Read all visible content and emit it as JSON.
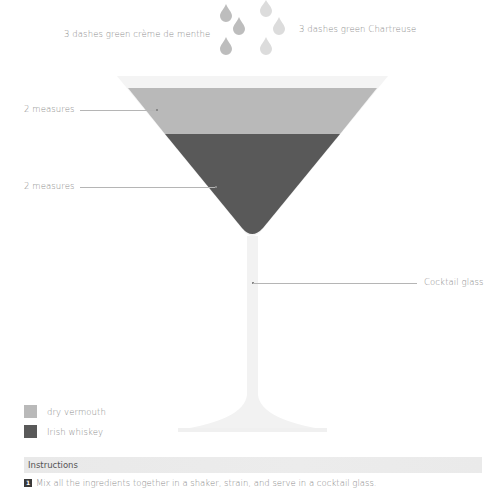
{
  "garnish": {
    "left_label": "3 dashes green crème de menthe",
    "right_label": "3 dashes green Chartreuse",
    "left_drop_color": "#bdbdbd",
    "right_drop_color": "#dcdcdc"
  },
  "glass": {
    "label": "Cocktail glass",
    "rim_color": "#f3f3f3",
    "stem_color": "#f2f2f2"
  },
  "layers": [
    {
      "measure_label": "2 measures",
      "ingredient": "dry vermouth",
      "color": "#b9b9b9"
    },
    {
      "measure_label": "2 measures",
      "ingredient": "Irish whiskey",
      "color": "#595959"
    }
  ],
  "legend": [
    {
      "label": "dry vermouth",
      "color": "#b9b9b9"
    },
    {
      "label": "Irish whiskey",
      "color": "#595959"
    }
  ],
  "instructions": {
    "title": "Instructions",
    "steps": [
      {
        "number": "1",
        "text": "Mix all the ingredients together in a shaker, strain, and serve in a cocktail glass."
      }
    ]
  }
}
